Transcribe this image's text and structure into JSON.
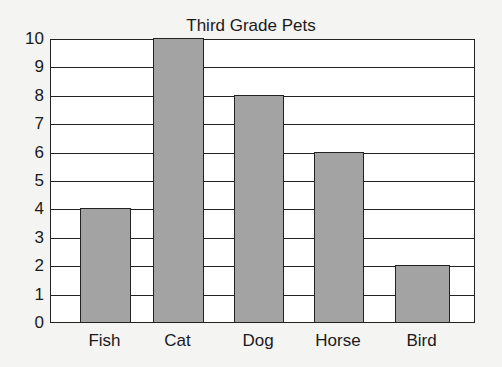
{
  "chart_data": {
    "type": "bar",
    "title": "Third Grade Pets",
    "categories": [
      "Fish",
      "Cat",
      "Dog",
      "Horse",
      "Bird"
    ],
    "values": [
      4,
      10,
      8,
      6,
      2
    ],
    "xlabel": "",
    "ylabel": "",
    "ylim": [
      0,
      10
    ],
    "yticks": [
      0,
      1,
      2,
      3,
      4,
      5,
      6,
      7,
      8,
      9,
      10
    ],
    "grid": true,
    "legend": null,
    "bar_color": "#a3a3a3"
  }
}
